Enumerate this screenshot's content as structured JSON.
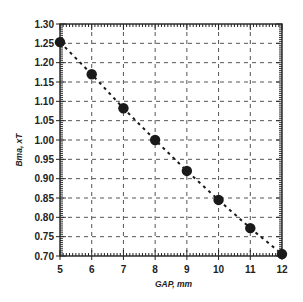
{
  "chart_data": {
    "type": "scatter",
    "title": "",
    "xlabel": "GAP, mm",
    "ylabel": "Bma, xT",
    "xlim": [
      5,
      12
    ],
    "ylim": [
      0.7,
      1.3
    ],
    "x_ticks": [
      5,
      6,
      7,
      8,
      9,
      10,
      11,
      12
    ],
    "y_ticks": [
      0.7,
      0.75,
      0.8,
      0.85,
      0.9,
      0.95,
      1.0,
      1.05,
      1.1,
      1.15,
      1.2,
      1.25,
      1.3
    ],
    "grid": true,
    "grid_style": "dashed",
    "legend": null,
    "series": [
      {
        "name": "Bmax",
        "marker": "filled-circle",
        "line": "dashed",
        "color": "#1a1a1a",
        "x": [
          5,
          6,
          7,
          8,
          9,
          10,
          11,
          12
        ],
        "y": [
          1.253,
          1.17,
          1.082,
          1.0,
          0.92,
          0.845,
          0.772,
          0.705
        ]
      }
    ]
  }
}
